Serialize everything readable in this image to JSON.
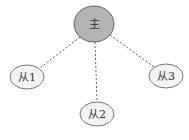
{
  "diagram": {
    "type": "master-slave topology",
    "master": {
      "label": "主",
      "fill": "#b4b4b4",
      "cx": 94,
      "cy": 24,
      "rx": 20,
      "ry": 18
    },
    "slaves": [
      {
        "label": "从1",
        "fill": "#f3f3f3",
        "cx": 27,
        "cy": 77,
        "rx": 17,
        "ry": 12
      },
      {
        "label": "从2",
        "fill": "#f3f3f3",
        "cx": 97,
        "cy": 114,
        "rx": 17,
        "ry": 12
      },
      {
        "label": "从3",
        "fill": "#f3f3f3",
        "cx": 166,
        "cy": 76,
        "rx": 17,
        "ry": 12
      }
    ],
    "edges": [
      {
        "from": "主",
        "to": "从1",
        "style": "dashed"
      },
      {
        "from": "主",
        "to": "从2",
        "style": "dashed"
      },
      {
        "from": "主",
        "to": "从3",
        "style": "dashed"
      }
    ]
  }
}
